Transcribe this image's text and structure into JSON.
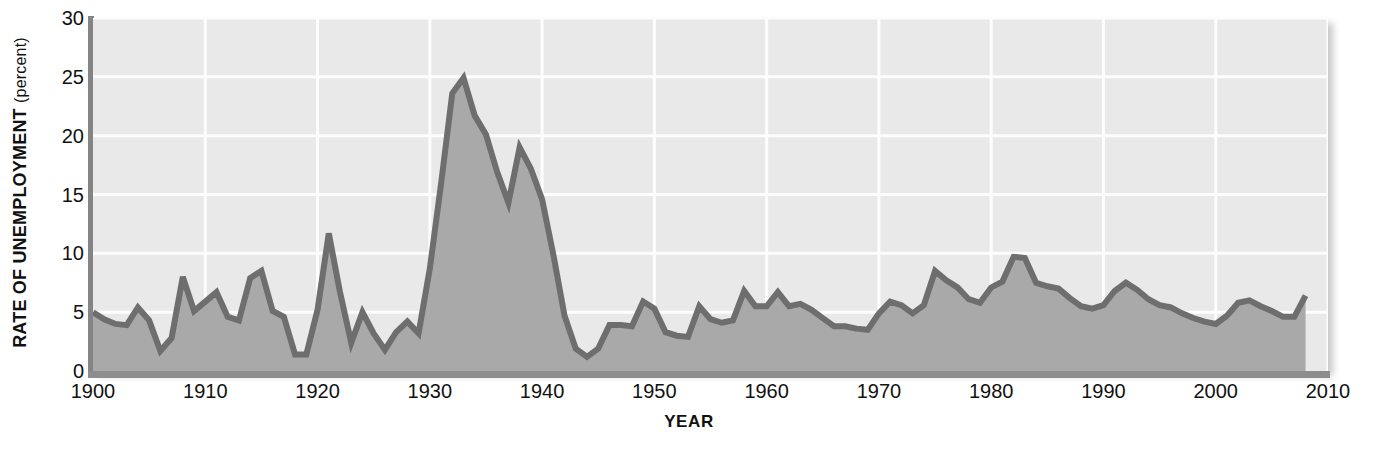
{
  "chart_data": {
    "type": "area",
    "title": "",
    "xlabel": "YEAR",
    "ylabel": "RATE OF UNEMPLOYMENT",
    "ylabel_unit": "(percent)",
    "xlim": [
      1900,
      2010
    ],
    "ylim": [
      0,
      30
    ],
    "grid": true,
    "legend": null,
    "xticks": [
      1900,
      1910,
      1920,
      1930,
      1940,
      1950,
      1960,
      1970,
      1980,
      1990,
      2000,
      2010
    ],
    "yticks": [
      0,
      5,
      10,
      15,
      20,
      25,
      30
    ],
    "series": [
      {
        "name": "Rate of unemployment",
        "x": [
          1900,
          1901,
          1902,
          1903,
          1904,
          1905,
          1906,
          1907,
          1908,
          1909,
          1910,
          1911,
          1912,
          1913,
          1914,
          1915,
          1916,
          1917,
          1918,
          1919,
          1920,
          1921,
          1922,
          1923,
          1924,
          1925,
          1926,
          1927,
          1928,
          1929,
          1930,
          1931,
          1932,
          1933,
          1934,
          1935,
          1936,
          1937,
          1938,
          1939,
          1940,
          1941,
          1942,
          1943,
          1944,
          1945,
          1946,
          1947,
          1948,
          1949,
          1950,
          1951,
          1952,
          1953,
          1954,
          1955,
          1956,
          1957,
          1958,
          1959,
          1960,
          1961,
          1962,
          1963,
          1964,
          1965,
          1966,
          1967,
          1968,
          1969,
          1970,
          1971,
          1972,
          1973,
          1974,
          1975,
          1976,
          1977,
          1978,
          1979,
          1980,
          1981,
          1982,
          1983,
          1984,
          1985,
          1986,
          1987,
          1988,
          1989,
          1990,
          1991,
          1992,
          1993,
          1994,
          1995,
          1996,
          1997,
          1998,
          1999,
          2000,
          2001,
          2002,
          2003,
          2004,
          2005,
          2006,
          2007,
          2008
        ],
        "y": [
          5.0,
          4.4,
          4.0,
          3.9,
          5.4,
          4.3,
          1.7,
          2.8,
          8.0,
          5.1,
          5.9,
          6.7,
          4.6,
          4.3,
          7.9,
          8.5,
          5.1,
          4.6,
          1.4,
          1.4,
          5.2,
          11.7,
          6.7,
          2.4,
          5.0,
          3.2,
          1.8,
          3.3,
          4.2,
          3.2,
          8.7,
          15.9,
          23.6,
          24.9,
          21.7,
          20.1,
          16.9,
          14.3,
          19.0,
          17.2,
          14.6,
          9.9,
          4.7,
          1.9,
          1.2,
          1.9,
          3.9,
          3.9,
          3.8,
          5.9,
          5.3,
          3.3,
          3.0,
          2.9,
          5.5,
          4.4,
          4.1,
          4.3,
          6.8,
          5.5,
          5.5,
          6.7,
          5.5,
          5.7,
          5.2,
          4.5,
          3.8,
          3.8,
          3.6,
          3.5,
          4.9,
          5.9,
          5.6,
          4.9,
          5.6,
          8.5,
          7.7,
          7.1,
          6.1,
          5.8,
          7.1,
          7.6,
          9.7,
          9.6,
          7.5,
          7.2,
          7.0,
          6.2,
          5.5,
          5.3,
          5.6,
          6.8,
          7.5,
          6.9,
          6.1,
          5.6,
          5.4,
          4.9,
          4.5,
          4.2,
          4.0,
          4.7,
          5.8,
          6.0,
          5.5,
          5.1,
          4.6,
          4.6,
          6.4
        ]
      }
    ]
  },
  "colors": {
    "plot_background": "#e9e9e9",
    "area_fill": "#a9a9a9",
    "line": "#6e6e6e",
    "gridline": "#fdfdfd",
    "axis": "#8b8b8b",
    "text": "#111111"
  }
}
